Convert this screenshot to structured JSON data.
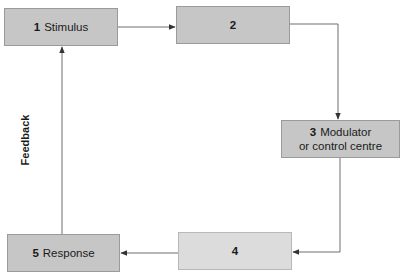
{
  "diagram": {
    "title": "",
    "nodes": [
      {
        "id": "1",
        "number": "1",
        "label": "Stimulus",
        "fill": "#c6c6c6"
      },
      {
        "id": "2",
        "number": "2",
        "label": "",
        "fill": "#c6c6c6"
      },
      {
        "id": "3",
        "number": "3",
        "label_line1": "Modulator",
        "label_line2": "or control centre",
        "fill": "#c6c6c6"
      },
      {
        "id": "4",
        "number": "4",
        "label": "",
        "fill": "#dcdcdc"
      },
      {
        "id": "5",
        "number": "5",
        "label": "Response",
        "fill": "#c6c6c6"
      }
    ],
    "edges": [
      {
        "from": "1",
        "to": "2"
      },
      {
        "from": "2",
        "to": "3"
      },
      {
        "from": "3",
        "to": "4"
      },
      {
        "from": "4",
        "to": "5"
      },
      {
        "from": "5",
        "to": "1",
        "label": "Feedback"
      }
    ],
    "feedback_label": "Feedback",
    "colors": {
      "line": "#6e6e6e",
      "box_border": "#9a9a9a"
    }
  }
}
